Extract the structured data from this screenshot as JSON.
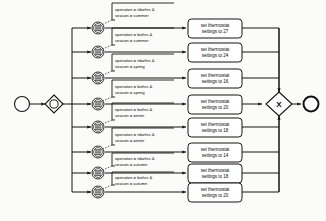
{
  "diagram": {
    "type": "bpmn-process-diagram",
    "colors": {
      "stroke": "#141414",
      "background": "#fbfbfa",
      "shape_fill": "#ffffff",
      "event_band": "#2a2a2a"
    },
    "start_event": {
      "name": "start-event",
      "label": ""
    },
    "split_gateway": {
      "name": "inclusive-split-gateway",
      "label": ""
    },
    "join_gateway": {
      "name": "exclusive-join-gateway",
      "label": "X"
    },
    "end_event": {
      "name": "end-event",
      "label": ""
    },
    "branches": [
      {
        "id": 1,
        "condition_line1": "operation = nbizhrs &",
        "condition_line2": "season = summer",
        "event": "conditional-intermediate-event",
        "task_line1": "set thermostat",
        "task_line2": "settings to 27",
        "value": 27,
        "operation": "nbizhrs",
        "season": "summer"
      },
      {
        "id": 2,
        "condition_line1": "operation = bizhrs &",
        "condition_line2": "season = summer",
        "event": "conditional-intermediate-event",
        "task_line1": "set thermostat",
        "task_line2": "settings to 24",
        "value": 24,
        "operation": "bizhrs",
        "season": "summer"
      },
      {
        "id": 3,
        "condition_line1": "operation = nbizhrs &",
        "condition_line2": "season = spring",
        "event": "conditional-intermediate-event",
        "task_line1": "set thermostat",
        "task_line2": "settings to 16",
        "value": 16,
        "operation": "nbizhrs",
        "season": "spring"
      },
      {
        "id": 4,
        "condition_line1": "operation = bizhrs &",
        "condition_line2": "season = spring",
        "event": "conditional-intermediate-event",
        "task_line1": "set thermostat",
        "task_line2": "settings to 20",
        "value": 20,
        "operation": "bizhrs",
        "season": "spring"
      },
      {
        "id": 5,
        "condition_line1": "operation = bizhrs &",
        "condition_line2": "season = winter",
        "event": "conditional-intermediate-event",
        "task_line1": "set thermostat",
        "task_line2": "settings to 18",
        "value": 18,
        "operation": "bizhrs",
        "season": "winter"
      },
      {
        "id": 6,
        "condition_line1": "operation = nbizhrs &",
        "condition_line2": "season = winter",
        "event": "conditional-intermediate-event",
        "task_line1": "set thermostat",
        "task_line2": "settings to 14",
        "value": 14,
        "operation": "nbizhrs",
        "season": "winter"
      },
      {
        "id": 7,
        "condition_line1": "operation = nbizhrs &",
        "condition_line2": "season = autumn",
        "event": "conditional-intermediate-event",
        "task_line1": "set thermostat",
        "task_line2": "settings to 18",
        "value": 18,
        "operation": "nbizhrs",
        "season": "autumn"
      },
      {
        "id": 8,
        "condition_line1": "operation = bizhrs &",
        "condition_line2": "season = autumn",
        "event": "conditional-intermediate-event",
        "task_line1": "set thermostat",
        "task_line2": "settings to 20",
        "value": 20,
        "operation": "bizhrs",
        "season": "autumn"
      }
    ]
  }
}
